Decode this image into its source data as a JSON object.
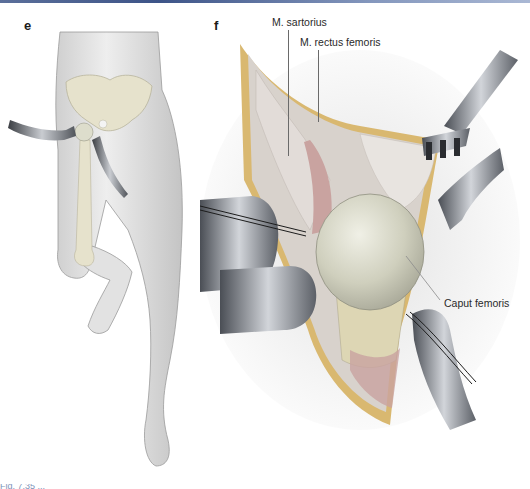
{
  "figure": {
    "panels": [
      {
        "letter": "e",
        "description": "Lower body with pelvis and femur shown, hip retractors in place, left leg flexed"
      },
      {
        "letter": "f",
        "description": "Surgical field view of exposed femoral head with retractors",
        "labels": [
          {
            "text": "M. sartorius"
          },
          {
            "text": "M. rectus femoris"
          },
          {
            "text": "Caput femoris"
          }
        ]
      }
    ],
    "caption_fragment": "Fig. 7.35 ..."
  },
  "colors": {
    "header_rule": "#3d5488",
    "skin": "#e8e8e8",
    "bone": "#e6e2cc",
    "fat": "#d9b870",
    "muscle": "#c9a3a0",
    "femoral_head": "#d5d5c4",
    "retractor": "#7a7f86"
  }
}
